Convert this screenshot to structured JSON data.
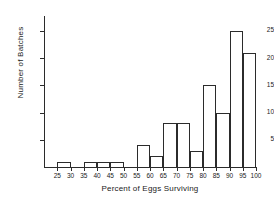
{
  "chart_data": {
    "type": "bar",
    "title": "",
    "subtitle": "",
    "xlabel": "Percent of Eggs Surviving",
    "ylabel": "Number of Batches",
    "xlim": [
      20,
      100
    ],
    "ylim": [
      0,
      27
    ],
    "grid": false,
    "legend": false,
    "x_ticks": [
      25,
      30,
      35,
      40,
      45,
      50,
      55,
      60,
      65,
      70,
      75,
      80,
      85,
      90,
      95,
      100
    ],
    "x_tick_labels": [
      "25",
      "30",
      "35",
      "40",
      "45",
      "50",
      "55",
      "60",
      "65",
      "70",
      "75",
      "80",
      "85",
      "90",
      "95",
      "100"
    ],
    "y_ticks": [
      5,
      10,
      15,
      20,
      25
    ],
    "y_tick_labels": [
      "5",
      "10",
      "15",
      "20",
      "25"
    ],
    "bin_width": 5,
    "bins": [
      {
        "start": 25,
        "end": 30,
        "value": 1
      },
      {
        "start": 30,
        "end": 35,
        "value": 0
      },
      {
        "start": 35,
        "end": 40,
        "value": 1
      },
      {
        "start": 40,
        "end": 45,
        "value": 1
      },
      {
        "start": 45,
        "end": 50,
        "value": 1
      },
      {
        "start": 50,
        "end": 55,
        "value": 0
      },
      {
        "start": 55,
        "end": 60,
        "value": 4
      },
      {
        "start": 60,
        "end": 65,
        "value": 2
      },
      {
        "start": 65,
        "end": 70,
        "value": 8
      },
      {
        "start": 70,
        "end": 75,
        "value": 8
      },
      {
        "start": 75,
        "end": 80,
        "value": 3
      },
      {
        "start": 80,
        "end": 85,
        "value": 15
      },
      {
        "start": 85,
        "end": 90,
        "value": 10
      },
      {
        "start": 90,
        "end": 95,
        "value": 25
      },
      {
        "start": 95,
        "end": 100,
        "value": 21
      }
    ],
    "categories": [
      "25-30",
      "30-35",
      "35-40",
      "40-45",
      "45-50",
      "50-55",
      "55-60",
      "60-65",
      "65-70",
      "70-75",
      "75-80",
      "80-85",
      "85-90",
      "90-95",
      "95-100"
    ],
    "values": [
      1,
      0,
      1,
      1,
      1,
      0,
      4,
      2,
      8,
      8,
      3,
      15,
      10,
      25,
      21
    ],
    "colors": {
      "axis": "#2b2b2b",
      "bar_stroke": "#2b2b2b",
      "bar_fill": "transparent",
      "text": "#1a1a1a",
      "background": "#ffffff"
    }
  }
}
